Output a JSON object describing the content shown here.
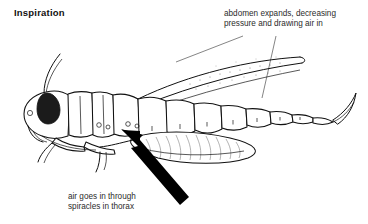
{
  "figure": {
    "title": "Inspiration",
    "background_color": "#ffffff",
    "ink_color": "#111111"
  },
  "annotations": [
    {
      "id": "abdomen-note",
      "text": "abdomen expands, decreasing\npressure and drawing air in",
      "leader_lines": 2
    },
    {
      "id": "spiracle-note",
      "text": "air goes in through\nspiracles in thorax",
      "arrow": "thick-black-arrow-up-left"
    }
  ],
  "labels": {
    "title": "Inspiration",
    "abdomen_note": "abdomen expands, decreasing\npressure and drawing air in",
    "spiracle_note": "air goes in through\nspiracles in thorax"
  },
  "anatomy": {
    "parts": [
      "antenna",
      "compound-eye",
      "head",
      "pronotum",
      "thorax",
      "wing",
      "abdomen-segments",
      "spiracles",
      "hind-femur",
      "foreleg",
      "midleg",
      "cercus"
    ],
    "abdomen_segment_count": 8
  }
}
